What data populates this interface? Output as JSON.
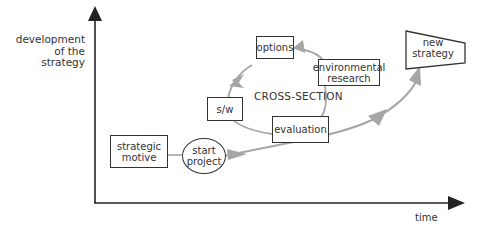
{
  "axes": {
    "y_label_lines": [
      "development",
      "of the",
      "strategy"
    ],
    "x_label": "time"
  },
  "center_label": "CROSS-SECTION",
  "nodes": {
    "strategic_motive": [
      "strategic",
      "motive"
    ],
    "start_project": [
      "start",
      "project"
    ],
    "evaluation": "evaluation",
    "sw": "s/w",
    "options": "options",
    "environmental_research": [
      "environmental",
      "research"
    ],
    "new_strategy": [
      "new",
      "strategy"
    ]
  },
  "colors": {
    "axis": "#222222",
    "arrow": "#a6a6a6",
    "box_border": "#333333"
  }
}
